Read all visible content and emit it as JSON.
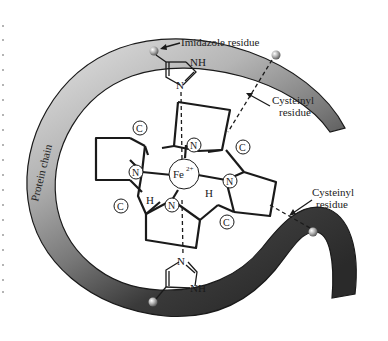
{
  "diagram": {
    "labels": {
      "imidazole_top": "Imidazole residue",
      "cysteinyl_top_line1": "Cysteinyl",
      "cysteinyl_top_line2": "residue",
      "cysteinyl_right_line1": "Cysteinyl",
      "cysteinyl_right_line2": "residue",
      "protein_chain": "Protein chain"
    },
    "atoms": {
      "iron": "Fe",
      "iron_charge": "2+",
      "nitrogen": "N",
      "carbon": "C",
      "hydrogen": "H",
      "nh": "NH"
    },
    "colors": {
      "chain_light": "#d9d9d9",
      "chain_mid": "#8c8c8c",
      "chain_dark": "#2e2e2e",
      "line": "#1a1a1a"
    }
  }
}
